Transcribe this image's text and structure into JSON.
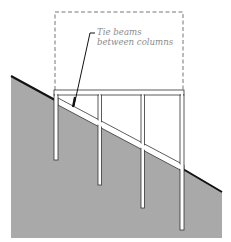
{
  "diagram": {
    "type": "structural-section",
    "annotation": {
      "line1": "Tie beams",
      "line2": "between columns"
    },
    "elements": {
      "building_envelope": "dashed outline",
      "ground": "sloped hillside (gray fill)",
      "columns": 4,
      "floor_bays": 3,
      "tie_beam": "diagonal beam following slope"
    },
    "colors": {
      "ground_fill": "#a9a9a9",
      "ground_edge": "#111111",
      "frame": "#ffffff",
      "frame_outline": "#333333",
      "dashed": "#666666",
      "label": "#8a8a8a"
    }
  }
}
